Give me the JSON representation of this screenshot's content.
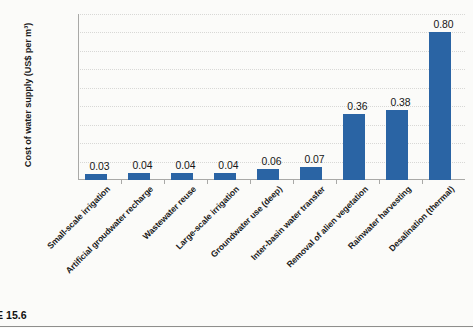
{
  "figure": {
    "caption": "E 15.6"
  },
  "chart_data": {
    "type": "bar",
    "title": "",
    "xlabel": "",
    "ylabel": "Cost of water supply (US$ per m³)",
    "ylim": [
      0.0,
      0.9
    ],
    "ytick_step": 0.1,
    "ytick_labels": [
      "0.00",
      "0.10",
      "0.20",
      "0.30",
      "0.40",
      "0.50",
      "0.60",
      "0.70",
      "0.80",
      "0.90"
    ],
    "grid": true,
    "legend": false,
    "bar_color": "#2a64a4",
    "categories": [
      "Small-scale irrigation",
      "Artificial groudwater recharge",
      "Wastewater reuse",
      "Large-scale irrigation",
      "Groundwater use (deep)",
      "Inter-basin water transfer",
      "Removal of alien vegetation",
      "Rainwater harvesting",
      "Desalination (thermal)"
    ],
    "values": [
      0.03,
      0.04,
      0.04,
      0.04,
      0.06,
      0.07,
      0.36,
      0.38,
      0.8
    ],
    "value_labels": [
      "0.03",
      "0.04",
      "0.04",
      "0.04",
      "0.06",
      "0.07",
      "0.36",
      "0.38",
      "0.80"
    ]
  }
}
